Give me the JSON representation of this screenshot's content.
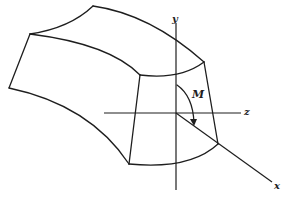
{
  "figure": {
    "axes": {
      "y_label": "y",
      "z_label": "z",
      "x_label": "x"
    },
    "moment_label": "M",
    "colors": {
      "line": "#1e1e1e",
      "background": "#ffffff"
    }
  }
}
